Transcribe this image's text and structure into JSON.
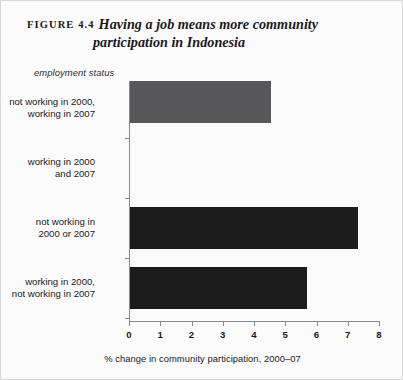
{
  "figure": {
    "number_label": "FIGURE 4.4",
    "title_line_1": "Having a job means more community",
    "title_line_2": "participation in Indonesia"
  },
  "chart_data": {
    "type": "bar",
    "orientation": "horizontal",
    "title": "Having a job means more community participation in Indonesia",
    "categories": [
      "not working in 2000, working in 2007",
      "working in 2000 and 2007",
      "not working in 2000 or 2007",
      "working in 2000, not working in 2007"
    ],
    "category_lines": [
      [
        "not working in 2000,",
        "working in 2007"
      ],
      [
        "working in 2000",
        "and 2007"
      ],
      [
        "not working in",
        "2000 or 2007"
      ],
      [
        "working in 2000,",
        "not working in 2007"
      ]
    ],
    "values": [
      7.3,
      5.65,
      4.5,
      2.4
    ],
    "bar_colors": [
      "#1c1c1c",
      "#1c1c1c",
      "#58585a",
      "#58585a"
    ],
    "xlabel": "% change in community participation, 2000–07",
    "ylabel": "employment status",
    "xlim": [
      0,
      8
    ],
    "xticks": [
      "0",
      "1",
      "2",
      "3",
      "4",
      "5",
      "6",
      "7",
      "8"
    ],
    "grid": false,
    "legend": "none"
  }
}
